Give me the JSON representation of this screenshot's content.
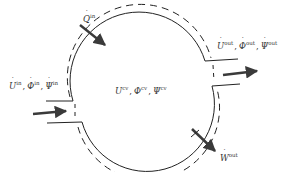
{
  "diagram": {
    "type": "control-volume",
    "colors": {
      "line": "#222222",
      "arrow": "#3a3a3a",
      "text": "#333333",
      "background": "#ffffff"
    },
    "labels": {
      "heat_in": {
        "symbol": "Q",
        "dot": true,
        "sup": "in"
      },
      "inlet": [
        {
          "symbol": "U",
          "dot": true,
          "sup": "in"
        },
        {
          "symbol": "Φ",
          "dot": true,
          "sup": "in"
        },
        {
          "symbol": "Ψ",
          "dot": true,
          "sup": "in"
        }
      ],
      "outlet": [
        {
          "symbol": "U",
          "dot": true,
          "sup": "out"
        },
        {
          "symbol": "Φ",
          "dot": true,
          "sup": "out"
        },
        {
          "symbol": "Ψ",
          "dot": true,
          "sup": "out"
        }
      ],
      "control_volume": [
        {
          "symbol": "U",
          "dot": false,
          "sup": "cv"
        },
        {
          "symbol": "Φ",
          "dot": false,
          "sup": "cv"
        },
        {
          "symbol": "Ψ",
          "dot": false,
          "sup": "cv"
        }
      ],
      "work_out": {
        "symbol": "W",
        "dot": true,
        "sup": "out"
      }
    },
    "separator": ","
  }
}
